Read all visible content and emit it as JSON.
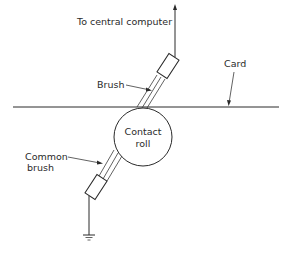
{
  "diagram": {
    "labels": {
      "to_computer": "To central computer",
      "card": "Card",
      "brush": "Brush",
      "contact_roll_line1": "Contact",
      "contact_roll_line2": "roll",
      "common_brush_line1": "Common",
      "common_brush_line2": "brush"
    },
    "colors": {
      "stroke": "#2a2a2a",
      "background": "#ffffff"
    }
  }
}
